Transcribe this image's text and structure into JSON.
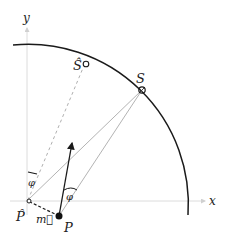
{
  "diagram": {
    "axes": {
      "x_label": "x",
      "y_label": "y"
    },
    "points": {
      "S": "S",
      "S_hat": "Ŝ",
      "P": "P",
      "P_hat": "P̂"
    },
    "vector_label": "m⃗",
    "angle_label": "φ",
    "colors": {
      "axis": "#d8d8d8",
      "arc": "#1a1a1a",
      "line": "#9a9a9a",
      "arrow": "#1a1a1a"
    }
  }
}
